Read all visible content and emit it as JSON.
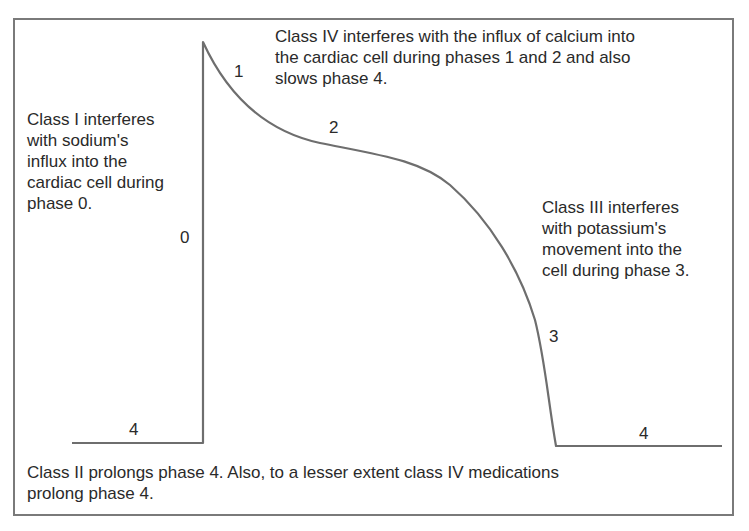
{
  "diagram": {
    "stroke_color": "#6e6e6e",
    "text_color": "#2a2a2a",
    "annotations": {
      "class_iv": "Class IV interferes with the influx of calcium into\nthe cardiac cell during phases 1 and 2 and also\nslows phase 4.",
      "class_i": "Class I interferes\nwith sodium's\ninflux into the\ncardiac cell during\nphase 0.",
      "class_iii": "Class III interferes\nwith potassium's\nmovement into the\ncell during phase 3.",
      "class_ii": "Class II prolongs phase 4. Also, to a lesser extent class IV medications\nprolong phase 4."
    },
    "phase_labels": {
      "phase_0": "0",
      "phase_1": "1",
      "phase_2": "2",
      "phase_3": "3",
      "phase_4_left": "4",
      "phase_4_right": "4"
    }
  }
}
